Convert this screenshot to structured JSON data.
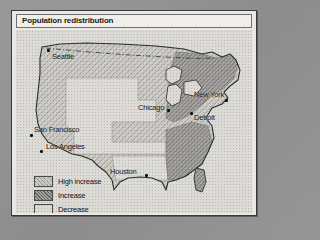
{
  "figure": {
    "title": "Population redistribution",
    "type": "thematic-choropleth-map",
    "region": "United States"
  },
  "legend": {
    "items": [
      {
        "label": "High increase",
        "pattern": "light-diagonal-hatch",
        "color": "#cdcbc6"
      },
      {
        "label": "Increase",
        "pattern": "dark-diagonal-hatch",
        "color": "#a5a3a0"
      },
      {
        "label": "Decrease",
        "pattern": "plain",
        "color": "#dcdad5"
      }
    ]
  },
  "map": {
    "cities": [
      {
        "name": "Seattle",
        "label_x": 36,
        "label_y": 22,
        "dot_x": 31,
        "dot_y": 19
      },
      {
        "name": "San Francisco",
        "label_x": 18,
        "label_y": 95,
        "dot_x": 14,
        "dot_y": 104
      },
      {
        "name": "Los Angeles",
        "label_x": 28,
        "label_y": 112,
        "dot_x": 24,
        "dot_y": 110
      },
      {
        "name": "Chicago",
        "label_x": 122,
        "label_y": 73,
        "dot_x": 151,
        "dot_y": 79
      },
      {
        "name": "New York",
        "label_x": 178,
        "label_y": 60,
        "dot_x": 205,
        "dot_y": 66
      },
      {
        "name": "Detroit",
        "label_x": 176,
        "label_y": 83,
        "dot_x": 174,
        "dot_y": 82
      },
      {
        "name": "Houston",
        "label_x": 94,
        "label_y": 138,
        "dot_x": 129,
        "dot_y": 144
      }
    ],
    "regions": [
      {
        "name": "west-coast-and-sunbelt",
        "category": "High increase"
      },
      {
        "name": "great-plains-interior",
        "category": "Decrease"
      },
      {
        "name": "southeast-and-texas",
        "category": "Increase"
      },
      {
        "name": "northeast-corridor",
        "category": "Increase"
      }
    ],
    "border_note": "US-Canada border shown as dashed line"
  }
}
